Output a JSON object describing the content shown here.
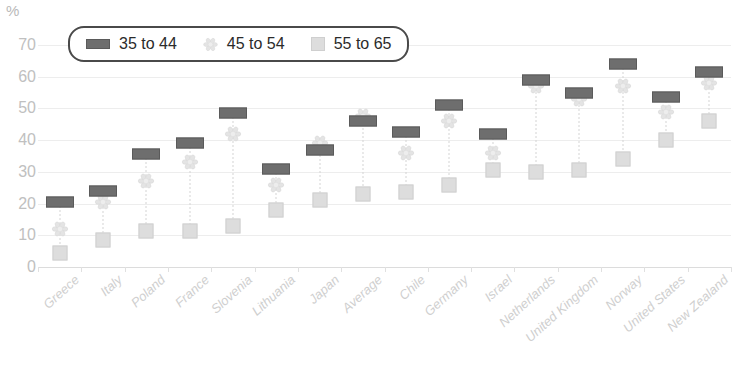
{
  "chart_data": {
    "type": "scatter",
    "title": "",
    "subtitle": "",
    "xlabel": "",
    "ylabel": "%",
    "ylim": [
      0,
      70
    ],
    "ytick_labels": [
      "0",
      "10",
      "20",
      "30",
      "40",
      "50",
      "60",
      "70"
    ],
    "yticks": [
      0,
      10,
      20,
      30,
      40,
      50,
      60,
      70
    ],
    "grid": true,
    "legend_position": "top-left",
    "categories": [
      "Greece",
      "Italy",
      "Poland",
      "France",
      "Slovenia",
      "Lithuania",
      "Japan",
      "Average",
      "Chile",
      "Germany",
      "Israel",
      "Netherlands",
      "United Kingdom",
      "Norway",
      "United States",
      "New Zealand"
    ],
    "series": [
      {
        "name": "35 to 44",
        "marker": "bar",
        "color": "#6e6e6e",
        "values": [
          20.5,
          24,
          35.5,
          39,
          48.5,
          31,
          37,
          46,
          42.5,
          51,
          42,
          59,
          55,
          64,
          53.5,
          61.5
        ]
      },
      {
        "name": "45 to 54",
        "marker": "flower",
        "color": "#e6e6e6",
        "values": [
          12,
          20.5,
          27,
          33,
          42,
          26,
          39,
          47.5,
          36,
          46,
          36,
          57,
          53,
          57,
          49,
          58
        ]
      },
      {
        "name": "55 to 65",
        "marker": "square",
        "color": "#dddddd",
        "values": [
          4.5,
          8.5,
          11.5,
          11.5,
          13,
          18,
          21,
          23,
          23.5,
          26,
          30.5,
          30,
          30.5,
          34,
          40,
          46
        ]
      }
    ]
  },
  "legend": {
    "items": [
      {
        "label": "35 to 44",
        "icon": "bar-marker-icon"
      },
      {
        "label": "45 to 54",
        "icon": "flower-marker-icon"
      },
      {
        "label": "55 to 65",
        "icon": "square-marker-icon"
      }
    ]
  }
}
